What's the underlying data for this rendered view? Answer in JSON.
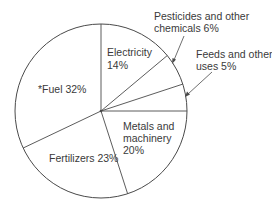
{
  "chart_data": {
    "type": "pie",
    "title": "",
    "start_angle_deg": 0,
    "direction": "clockwise",
    "slices": [
      {
        "label": "Electricity",
        "value": 14,
        "display": [
          "Electricity",
          "14%"
        ]
      },
      {
        "label": "Pesticides and other chemicals",
        "value": 6,
        "display": [
          "Pesticides and other",
          "chemicals 6%"
        ]
      },
      {
        "label": "Feeds and other uses",
        "value": 5,
        "display": [
          "Feeds and other",
          "uses 5%"
        ]
      },
      {
        "label": "Metals and machinery",
        "value": 20,
        "display": [
          "Metals and",
          "machinery",
          "20%"
        ]
      },
      {
        "label": "Fertilizers",
        "value": 23,
        "display": [
          "Fertilizers 23%"
        ]
      },
      {
        "label": "*Fuel",
        "value": 32,
        "display": [
          "*Fuel 32%"
        ]
      }
    ],
    "legend": "none",
    "grid": false,
    "colors": {
      "stroke": "#4a4a4a",
      "fill": "#ffffff",
      "text": "#3a3a3a"
    }
  },
  "labels": {
    "electricity_line1": "Electricity",
    "electricity_line2": "14%",
    "pesticides_line1": "Pesticides and other",
    "pesticides_line2": "chemicals 6%",
    "feeds_line1": "Feeds and other",
    "feeds_line2": "uses 5%",
    "metals_line1": "Metals and",
    "metals_line2": "machinery",
    "metals_line3": "20%",
    "fertilizers": "Fertilizers 23%",
    "fuel": "*Fuel 32%"
  }
}
